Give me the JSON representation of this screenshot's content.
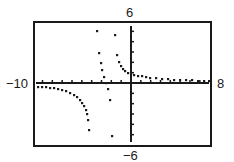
{
  "chart_data": {
    "type": "scatter",
    "title": "",
    "xlabel": "",
    "ylabel": "",
    "xlim": [
      -10,
      8
    ],
    "ylim": [
      -6,
      6
    ],
    "xscl": 1,
    "yscl": 1,
    "grid": false,
    "legend": null,
    "window_labels": {
      "xmin": "−10",
      "xmax": "8",
      "ymin": "−6",
      "ymax": "6"
    },
    "vertical_asymptotes": [
      -3.5,
      -2.0
    ],
    "horizontal_asymptote": 0.3,
    "series": [
      {
        "name": "left-branch",
        "points_px": [
          [
            38,
            87
          ],
          [
            42,
            87
          ],
          [
            46,
            87
          ],
          [
            50,
            88
          ],
          [
            54,
            88
          ],
          [
            58,
            89
          ],
          [
            62,
            90
          ],
          [
            66,
            91
          ],
          [
            70,
            93
          ],
          [
            74,
            95
          ],
          [
            77,
            97
          ],
          [
            80,
            100
          ],
          [
            82,
            103
          ],
          [
            84,
            106
          ],
          [
            86,
            110
          ],
          [
            87,
            114
          ],
          [
            88,
            120
          ],
          [
            89,
            130
          ]
        ]
      },
      {
        "name": "middle-branch-upper",
        "points_px": [
          [
            97,
            31
          ],
          [
            99,
            53
          ],
          [
            101,
            63
          ],
          [
            102,
            70
          ],
          [
            104,
            77
          ],
          [
            106,
            83
          ]
        ]
      },
      {
        "name": "middle-branch-lower",
        "points_px": [
          [
            108,
            89
          ],
          [
            110,
            100
          ],
          [
            112,
            136
          ]
        ]
      },
      {
        "name": "right-branch",
        "points_px": [
          [
            115,
            35
          ],
          [
            117,
            55
          ],
          [
            119,
            62
          ],
          [
            121,
            66
          ],
          [
            123,
            69
          ],
          [
            125,
            71
          ],
          [
            128,
            73
          ],
          [
            131,
            74
          ],
          [
            134,
            75
          ],
          [
            138,
            76
          ],
          [
            142,
            76
          ],
          [
            146,
            77
          ],
          [
            150,
            78
          ],
          [
            156,
            78
          ],
          [
            162,
            79
          ],
          [
            168,
            79
          ],
          [
            174,
            80
          ],
          [
            180,
            80
          ],
          [
            186,
            80
          ],
          [
            192,
            80
          ],
          [
            198,
            81
          ],
          [
            204,
            81
          ],
          [
            209,
            81
          ]
        ]
      }
    ]
  },
  "frame": {
    "left": 34,
    "top": 22,
    "right": 211,
    "bottom": 146
  },
  "axes": {
    "origin_px": [
      131,
      83
    ],
    "x_axis_y": 83,
    "y_axis_x": 131,
    "y_axis_top": 26,
    "y_axis_bottom": 142
  },
  "colors": {
    "ink": "#1a1a1a",
    "background": "#ffffff"
  }
}
